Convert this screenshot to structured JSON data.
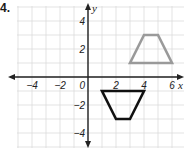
{
  "problem": {
    "number": "4."
  },
  "chart_data": {
    "type": "coordinate-plane",
    "title": "",
    "xlabel": "x",
    "ylabel": "y",
    "xlim": [
      -5,
      6.8
    ],
    "ylim": [
      -5,
      5
    ],
    "grid": true,
    "x_ticks": [
      {
        "value": -4,
        "label": "−4"
      },
      {
        "value": -2,
        "label": "−2"
      },
      {
        "value": 2,
        "label": "2"
      },
      {
        "value": 4,
        "label": "4"
      },
      {
        "value": 6,
        "label": "6"
      }
    ],
    "y_ticks": [
      {
        "value": 4,
        "label": "4"
      },
      {
        "value": 2,
        "label": "2"
      },
      {
        "value": -2,
        "label": "−2"
      },
      {
        "value": -4,
        "label": "−4"
      }
    ],
    "origin_label": "0",
    "shapes": [
      {
        "name": "gray-trapezoid",
        "type": "polygon",
        "color": "#9a9a9a",
        "points": [
          [
            3,
            1
          ],
          [
            4,
            3
          ],
          [
            5,
            3
          ],
          [
            6,
            1
          ]
        ]
      },
      {
        "name": "black-trapezoid",
        "type": "polygon",
        "color": "#111111",
        "points": [
          [
            1,
            -1
          ],
          [
            4,
            -1
          ],
          [
            3,
            -3
          ],
          [
            2,
            -3
          ]
        ]
      }
    ]
  }
}
